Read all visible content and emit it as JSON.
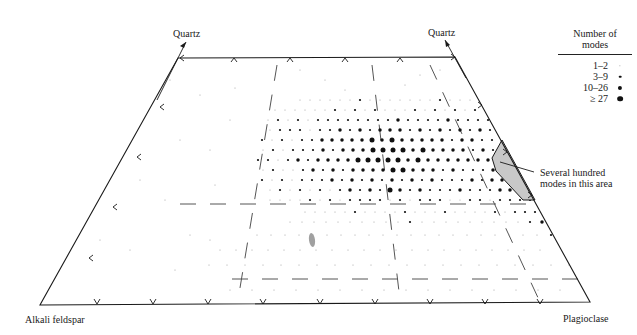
{
  "labels": {
    "quartz_left": "Quartz",
    "quartz_right": "Quartz",
    "alkali_feldspar": "Alkali feldspar",
    "plagioclase": "Plagioclase",
    "annotation_line1": "Several hundred",
    "annotation_line2": "modes in this area"
  },
  "legend": {
    "title_line1": "Number of",
    "title_line2": "modes",
    "entries": [
      {
        "label": "1–2",
        "size": 1.0
      },
      {
        "label": "3–9",
        "size": 2.0
      },
      {
        "label": "10–26",
        "size": 3.2
      },
      {
        "label": "≥ 27",
        "size": 4.4
      }
    ]
  },
  "colors": {
    "line": "#1a1a1a",
    "dash": "#555555",
    "polygon_fill": "#c8c8c8",
    "dot": "#111111",
    "faint_dot": "#9a9a9a",
    "blob": "#9a9a9a"
  },
  "geometry": {
    "outline": [
      [
        178,
        58
      ],
      [
        455,
        57
      ],
      [
        590,
        302
      ],
      [
        40,
        305
      ]
    ],
    "polygon": [
      [
        502,
        140
      ],
      [
        535,
        200
      ],
      [
        523,
        200
      ],
      [
        496,
        171
      ],
      [
        492,
        158
      ],
      [
        502,
        140
      ]
    ],
    "left_ticks": [
      [
        160,
        107
      ],
      [
        137,
        157
      ],
      [
        113,
        207
      ],
      [
        89,
        258
      ]
    ],
    "top_ticks": [
      [
        234,
        58
      ],
      [
        290,
        58
      ],
      [
        345,
        58
      ],
      [
        400,
        58
      ]
    ],
    "bottom_ticks": [
      [
        97,
        304
      ],
      [
        153,
        304
      ],
      [
        208,
        304
      ],
      [
        263,
        304
      ],
      [
        320,
        304
      ],
      [
        375,
        304
      ],
      [
        430,
        304
      ],
      [
        485,
        304
      ],
      [
        540,
        304
      ]
    ],
    "right_ticks": [
      [
        482,
        105
      ],
      [
        507,
        152
      ],
      [
        532,
        195
      ]
    ],
    "dashed_vertical": [
      [
        [
          277,
          65
        ],
        [
          238,
          300
        ]
      ],
      [
        [
          372,
          65
        ],
        [
          400,
          300
        ]
      ],
      [
        [
          430,
          65
        ],
        [
          540,
          302
        ]
      ]
    ],
    "dashed_horizontal": [
      [
        [
          180,
          204
        ],
        [
          540,
          204
        ]
      ],
      [
        [
          232,
          279
        ],
        [
          580,
          279
        ]
      ]
    ],
    "annotation_leader": [
      [
        500,
        162
      ],
      [
        534,
        172
      ]
    ]
  },
  "chart_data": {
    "type": "scatter",
    "vertices": [
      "Quartz",
      "Alkali feldspar",
      "Plagioclase"
    ],
    "legend_title": "Number of modes",
    "size_classes": [
      "1–2",
      "3–9",
      "10–26",
      "≥ 27"
    ],
    "annotation": "Several hundred modes in this area",
    "note": "Dot grid rows (y) with x-spans and size class per column; concentration centered near tonalite–granodiorite–granite field",
    "rows": [
      {
        "y": 100,
        "x0": 300,
        "x1": 500,
        "step": 10,
        "sizes": "1111112111111121111121"
      },
      {
        "y": 110,
        "x0": 270,
        "x1": 505,
        "step": 10,
        "sizes": "111111212121112121212122"
      },
      {
        "y": 120,
        "x0": 268,
        "x1": 500,
        "step": 10,
        "sizes": "121212222222232222322223"
      },
      {
        "y": 130,
        "x0": 265,
        "x1": 495,
        "step": 10,
        "sizes": "12221223232333232323232"
      },
      {
        "y": 140,
        "x0": 262,
        "x1": 495,
        "step": 10,
        "sizes": "212122333334343333323322"
      },
      {
        "y": 150,
        "x0": 258,
        "x1": 492,
        "step": 10,
        "sizes": "1212223233344443433332322"
      },
      {
        "y": 160,
        "x0": 258,
        "x1": 495,
        "step": 10,
        "sizes": "221232333344444343333333"
      },
      {
        "y": 170,
        "x0": 258,
        "x1": 505,
        "step": 10,
        "sizes": "1211232323333443332322232"
      },
      {
        "y": 180,
        "x0": 262,
        "x1": 515,
        "step": 10,
        "sizes": "21212223232323232322232332"
      },
      {
        "y": 190,
        "x0": 265,
        "x1": 525,
        "step": 10,
        "sizes": "121212123232432322232223323"
      },
      {
        "y": 200,
        "x0": 270,
        "x1": 535,
        "step": 10,
        "sizes": "1111212122221212221122122223"
      },
      {
        "y": 212,
        "x0": 300,
        "x1": 545,
        "step": 10,
        "sizes": "1111121111211121111212223"
      },
      {
        "y": 222,
        "x0": 290,
        "x1": 550,
        "step": 12,
        "sizes": "1111111111211111111123"
      },
      {
        "y": 235,
        "x0": 250,
        "x1": 560,
        "step": 14,
        "sizes": "1111111111111111111112"
      },
      {
        "y": 250,
        "x0": 220,
        "x1": 565,
        "step": 16,
        "sizes": "111111111111111111111"
      },
      {
        "y": 265,
        "x0": 200,
        "x1": 570,
        "step": 18,
        "sizes": "111111111111111111111"
      },
      {
        "y": 290,
        "x0": 230,
        "x1": 580,
        "step": 22,
        "sizes": "1111111111111111"
      }
    ],
    "scatter_sparse": [
      [
        170,
        80
      ],
      [
        200,
        95
      ],
      [
        180,
        140
      ],
      [
        165,
        200
      ],
      [
        190,
        235
      ],
      [
        130,
        250
      ],
      [
        175,
        270
      ],
      [
        210,
        240
      ],
      [
        300,
        70
      ],
      [
        325,
        80
      ],
      [
        345,
        90
      ],
      [
        420,
        75
      ],
      [
        440,
        70
      ],
      [
        405,
        85
      ],
      [
        235,
        88
      ],
      [
        230,
        120
      ],
      [
        210,
        150
      ],
      [
        215,
        185
      ],
      [
        140,
        180
      ],
      [
        100,
        240
      ]
    ]
  }
}
